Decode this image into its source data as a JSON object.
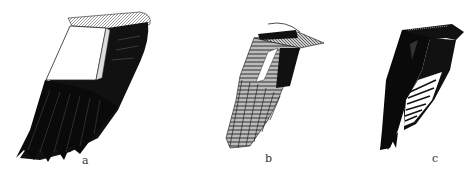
{
  "figure": {
    "panels": [
      {
        "id": "a",
        "label": "a",
        "subject": "dark wing with large white patch on inner wing"
      },
      {
        "id": "b",
        "label": "b",
        "subject": "barred/patterned wing with white stripe"
      },
      {
        "id": "c",
        "label": "c",
        "subject": "dark wing with white-barred inner flight feathers"
      }
    ]
  }
}
